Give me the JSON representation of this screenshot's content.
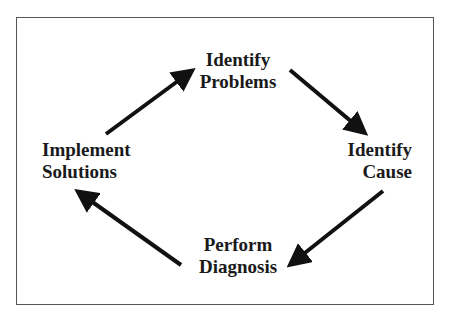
{
  "diagram": {
    "type": "cycle",
    "nodes": [
      {
        "id": "identify-problems",
        "line1": "Identify",
        "line2": "Problems"
      },
      {
        "id": "identify-cause",
        "line1": "Identify",
        "line2": "Cause"
      },
      {
        "id": "perform-diagnosis",
        "line1": "Perform",
        "line2": "Diagnosis"
      },
      {
        "id": "implement-solutions",
        "line1": "Implement",
        "line2": "Solutions"
      }
    ],
    "edges": [
      {
        "from": "identify-problems",
        "to": "identify-cause"
      },
      {
        "from": "identify-cause",
        "to": "perform-diagnosis"
      },
      {
        "from": "perform-diagnosis",
        "to": "implement-solutions"
      },
      {
        "from": "implement-solutions",
        "to": "identify-problems"
      }
    ]
  }
}
